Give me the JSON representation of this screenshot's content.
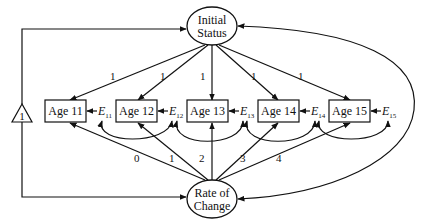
{
  "diagram": {
    "type": "latent growth curve path diagram",
    "latent_factors": {
      "initial_status": {
        "line1": "Initial",
        "line2": "Status"
      },
      "rate_of_change": {
        "line1": "Rate of",
        "line2": "Change"
      }
    },
    "constant": {
      "label": "1"
    },
    "observed": [
      {
        "label": "Age 11",
        "error": "E",
        "error_sub": "11",
        "intercept_loading": "1",
        "slope_loading": "0"
      },
      {
        "label": "Age 12",
        "error": "E",
        "error_sub": "12",
        "intercept_loading": "1",
        "slope_loading": "1"
      },
      {
        "label": "Age 13",
        "error": "E",
        "error_sub": "13",
        "intercept_loading": "1",
        "slope_loading": "2"
      },
      {
        "label": "Age 14",
        "error": "E",
        "error_sub": "14",
        "intercept_loading": "1",
        "slope_loading": "3"
      },
      {
        "label": "Age 15",
        "error": "E",
        "error_sub": "15",
        "intercept_loading": "1",
        "slope_loading": "4"
      }
    ],
    "colors": {
      "stroke": "#111111",
      "background": "#ffffff"
    }
  }
}
